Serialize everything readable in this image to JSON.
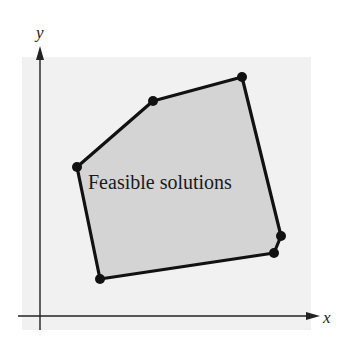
{
  "diagram": {
    "region_label": "Feasible solutions",
    "x_axis_label": "x",
    "y_axis_label": "y",
    "colors": {
      "background_panel": "#f1f1f1",
      "region_fill": "#d4d4d4",
      "edge": "#111111",
      "axis": "#222222"
    },
    "vertices": [
      {
        "x": 77,
        "y": 167
      },
      {
        "x": 153,
        "y": 101
      },
      {
        "x": 242,
        "y": 77
      },
      {
        "x": 281,
        "y": 236
      },
      {
        "x": 274,
        "y": 253
      },
      {
        "x": 100,
        "y": 279
      }
    ]
  }
}
